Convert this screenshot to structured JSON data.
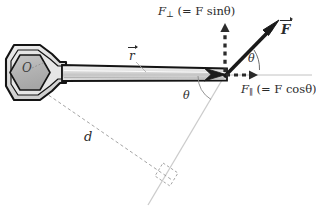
{
  "figure": {
    "background_color": "#ffffff"
  },
  "labels": {
    "force_perp": {
      "symbol": "F",
      "subscript": "⊥",
      "expression": "(= F sinθ)",
      "name": "perpendicular force component"
    },
    "force_par": {
      "symbol": "F",
      "subscript": "∥",
      "expression": "(= F cosθ)",
      "name": "parallel force component"
    },
    "force_vector": {
      "symbol": "F",
      "name": "applied force vector"
    },
    "r_vector": {
      "symbol": "r",
      "name": "position vector from pivot"
    },
    "moment_arm": {
      "symbol": "d",
      "name": "moment arm"
    },
    "angle_upper": "θ",
    "angle_lower": "θ",
    "pivot": "O"
  },
  "colors": {
    "force_line": "#1a1a1a",
    "wrench_outline": "#141414",
    "wrench_fill": "#d8d8d8",
    "wrench_socket_fill": "#b4b4b4",
    "dashed_component": "#2b2b2b",
    "moment_arm_line": "#8d8d8d",
    "action_line": "#c9c9c9",
    "text": "#2b2b2b"
  },
  "geometry": {
    "pivot_point": [
      34,
      72
    ],
    "force_application_point": [
      225,
      75
    ],
    "force_tip": [
      277,
      24
    ],
    "angle_degrees": 45,
    "handle_length_px": 191
  }
}
